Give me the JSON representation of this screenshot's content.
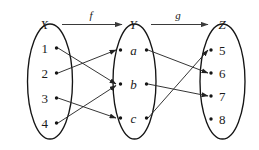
{
  "diagram": {
    "title_labels": {
      "set_x": "X",
      "set_y": "Y",
      "set_z": "Z",
      "map_f": "f",
      "map_g": "g"
    },
    "sets": [
      {
        "name": "X",
        "label": "X",
        "elements": [
          {
            "id": "1",
            "label": "1"
          },
          {
            "id": "2",
            "label": "2"
          },
          {
            "id": "3",
            "label": "3"
          },
          {
            "id": "4",
            "label": "4"
          }
        ]
      },
      {
        "name": "Y",
        "label": "Y",
        "elements": [
          {
            "id": "a",
            "label": "a"
          },
          {
            "id": "b",
            "label": "b"
          },
          {
            "id": "c",
            "label": "c"
          }
        ]
      },
      {
        "name": "Z",
        "label": "Z",
        "elements": [
          {
            "id": "5",
            "label": "5"
          },
          {
            "id": "6",
            "label": "6"
          },
          {
            "id": "7",
            "label": "7"
          },
          {
            "id": "8",
            "label": "8"
          }
        ]
      }
    ],
    "mappings": [
      {
        "name": "f",
        "label": "f",
        "from_set": "X",
        "to_set": "Y",
        "pairs": [
          {
            "from": "1",
            "to": "b"
          },
          {
            "from": "2",
            "to": "a"
          },
          {
            "from": "3",
            "to": "c"
          },
          {
            "from": "4",
            "to": "b"
          }
        ]
      },
      {
        "name": "g",
        "label": "g",
        "from_set": "Y",
        "to_set": "Z",
        "pairs": [
          {
            "from": "a",
            "to": "6"
          },
          {
            "from": "b",
            "to": "7"
          },
          {
            "from": "c",
            "to": "5"
          }
        ]
      }
    ],
    "unmapped_targets": [
      "8"
    ],
    "colors": {
      "background": "#ffffff",
      "stroke": "#151515",
      "edge": "#2a2a2a",
      "text": "#1a1a1a"
    }
  }
}
